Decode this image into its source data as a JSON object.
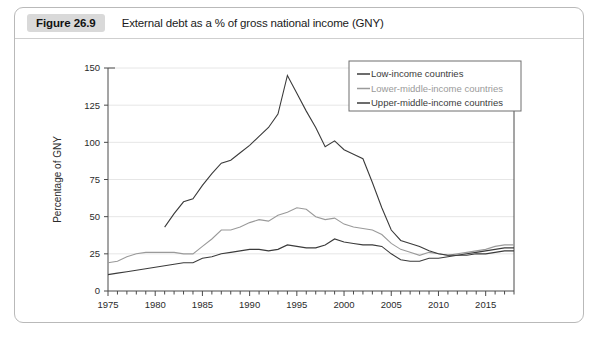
{
  "figure": {
    "number_label": "Figure 26.9",
    "caption": "External debt as a % of gross national income (GNY)"
  },
  "chart_data": {
    "type": "line",
    "title": "External debt as a % of gross national income (GNY)",
    "xlabel": "",
    "ylabel": "Percentage of GNY",
    "xlim": [
      1975,
      2018
    ],
    "ylim": [
      0,
      150
    ],
    "yticks": [
      0,
      25,
      50,
      75,
      100,
      125,
      150
    ],
    "ytick_labels": [
      "0",
      "25",
      "50",
      "75",
      "100",
      "125",
      "150"
    ],
    "xticks": [
      1975,
      1980,
      1985,
      1990,
      1995,
      2000,
      2005,
      2010,
      2015
    ],
    "xtick_labels": [
      "1975",
      "1980",
      "1985",
      "1990",
      "1995",
      "2000",
      "2005",
      "2010",
      "2015"
    ],
    "minor_xtick_interval": 1,
    "grid": "horizontal",
    "legend_position": "top-right",
    "x": [
      1975,
      1976,
      1977,
      1978,
      1979,
      1980,
      1981,
      1982,
      1983,
      1984,
      1985,
      1986,
      1987,
      1988,
      1989,
      1990,
      1991,
      1992,
      1993,
      1994,
      1995,
      1996,
      1997,
      1998,
      1999,
      2000,
      2001,
      2002,
      2003,
      2004,
      2005,
      2006,
      2007,
      2008,
      2009,
      2010,
      2011,
      2012,
      2013,
      2014,
      2015,
      2016,
      2017,
      2018
    ],
    "series": [
      {
        "name": "Low-income countries",
        "color": "#3b3b3b",
        "values": [
          11,
          12,
          13,
          14,
          15,
          16,
          17,
          18,
          19,
          19,
          22,
          23,
          25,
          26,
          27,
          28,
          28,
          27,
          28,
          31,
          30,
          29,
          29,
          31,
          35,
          33,
          32,
          31,
          31,
          30,
          25,
          21,
          20,
          20,
          22,
          22,
          23,
          24,
          24,
          25,
          25,
          26,
          27,
          27
        ]
      },
      {
        "name": "Lower-middle-income countries",
        "color": "#9a9a9a",
        "values": [
          19,
          20,
          23,
          25,
          26,
          26,
          26,
          26,
          25,
          25,
          30,
          35,
          41,
          41,
          43,
          46,
          48,
          47,
          51,
          53,
          56,
          55,
          50,
          48,
          49,
          45,
          43,
          42,
          41,
          38,
          32,
          28,
          26,
          24,
          26,
          25,
          24,
          25,
          26,
          27,
          28,
          30,
          31,
          31
        ]
      },
      {
        "name": "Upper-middle-income countries",
        "color": "#3b3b3b",
        "values": [
          null,
          null,
          null,
          null,
          null,
          null,
          43,
          52,
          60,
          62,
          71,
          79,
          86,
          88,
          93,
          98,
          104,
          110,
          119,
          145,
          133,
          121,
          110,
          97,
          101,
          95,
          92,
          89,
          73,
          56,
          41,
          34,
          32,
          30,
          27,
          25,
          24,
          24,
          25,
          26,
          27,
          28,
          29,
          29
        ]
      }
    ]
  }
}
